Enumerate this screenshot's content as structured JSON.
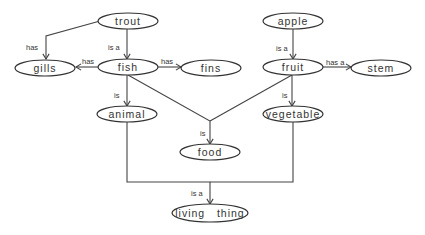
{
  "diagram": {
    "type": "semantic-network",
    "nodes": [
      {
        "id": "trout",
        "label": "trout",
        "cx": 128,
        "cy": 21,
        "rx": 30,
        "ry": 8
      },
      {
        "id": "gills",
        "label": "gills",
        "cx": 45,
        "cy": 68,
        "rx": 30,
        "ry": 8
      },
      {
        "id": "fish",
        "label": "fish",
        "cx": 128,
        "cy": 67,
        "rx": 30,
        "ry": 8
      },
      {
        "id": "fins",
        "label": "fins",
        "cx": 211,
        "cy": 68,
        "rx": 30,
        "ry": 8
      },
      {
        "id": "apple",
        "label": "apple",
        "cx": 293,
        "cy": 21,
        "rx": 30,
        "ry": 8
      },
      {
        "id": "fruit",
        "label": "fruit",
        "cx": 293,
        "cy": 67,
        "rx": 30,
        "ry": 8
      },
      {
        "id": "stem",
        "label": "stem",
        "cx": 381,
        "cy": 68,
        "rx": 30,
        "ry": 8
      },
      {
        "id": "animal",
        "label": "animal",
        "cx": 127,
        "cy": 114,
        "rx": 30,
        "ry": 8
      },
      {
        "id": "vegetable",
        "label": "vegetable",
        "cx": 293,
        "cy": 114,
        "rx": 30,
        "ry": 8
      },
      {
        "id": "food",
        "label": "food",
        "cx": 210,
        "cy": 152,
        "rx": 30,
        "ry": 8
      },
      {
        "id": "living_thing",
        "label": "living   thing",
        "cx": 210,
        "cy": 213,
        "rx": 38,
        "ry": 9
      }
    ],
    "edges": [
      {
        "from": "trout",
        "to": "gills",
        "label": "has",
        "points": [
          [
            100,
            21
          ],
          [
            46,
            36
          ],
          [
            46,
            59
          ]
        ],
        "label_x": 26,
        "label_y": 50
      },
      {
        "from": "trout",
        "to": "fish",
        "label": "is a",
        "points": [
          [
            127,
            29
          ],
          [
            127,
            59
          ]
        ],
        "label_x": 108,
        "label_y": 50
      },
      {
        "from": "fish",
        "to": "gills",
        "label": "has",
        "points": [
          [
            98,
            67
          ],
          [
            76,
            67
          ]
        ],
        "label_x": 82,
        "label_y": 64
      },
      {
        "from": "fish",
        "to": "fins",
        "label": "has",
        "points": [
          [
            158,
            67
          ],
          [
            181,
            67
          ]
        ],
        "label_x": 161,
        "label_y": 64
      },
      {
        "from": "fish",
        "to": "animal",
        "label": "is",
        "points": [
          [
            127,
            75
          ],
          [
            127,
            106
          ]
        ],
        "label_x": 114,
        "label_y": 98
      },
      {
        "from": "apple",
        "to": "fruit",
        "label": "is a",
        "points": [
          [
            293,
            29
          ],
          [
            293,
            59
          ]
        ],
        "label_x": 276,
        "label_y": 51
      },
      {
        "from": "fruit",
        "to": "stem",
        "label": "has a",
        "points": [
          [
            323,
            67
          ],
          [
            351,
            67
          ]
        ],
        "label_x": 326,
        "label_y": 65
      },
      {
        "from": "fruit",
        "to": "vegetable",
        "label": "is",
        "points": [
          [
            292,
            75
          ],
          [
            292,
            106
          ]
        ],
        "label_x": 282,
        "label_y": 98
      },
      {
        "from": "fish",
        "to": "food",
        "label": "is",
        "points": [
          [
            128,
            75
          ],
          [
            210,
            121
          ],
          [
            210,
            144
          ]
        ],
        "label_x": 200,
        "label_y": 136,
        "merge_with": "fruit"
      },
      {
        "from": "fruit",
        "to": "food",
        "label": "",
        "points": [
          [
            292,
            75
          ],
          [
            210,
            121
          ]
        ],
        "arrow": false
      },
      {
        "from": "animal",
        "to": "living_thing",
        "label": "is a",
        "points": [
          [
            127,
            122
          ],
          [
            127,
            182
          ],
          [
            210,
            182
          ],
          [
            210,
            204
          ]
        ],
        "label_x": 191,
        "label_y": 196,
        "merge_with": "vegetable"
      },
      {
        "from": "vegetable",
        "to": "living_thing",
        "label": "",
        "points": [
          [
            293,
            122
          ],
          [
            293,
            182
          ],
          [
            210,
            182
          ]
        ],
        "arrow": false
      }
    ]
  }
}
